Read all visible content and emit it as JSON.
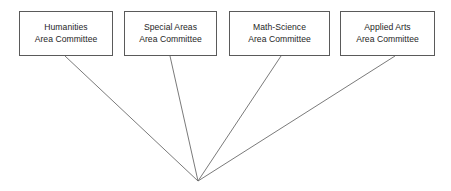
{
  "diagram": {
    "background_color": "#ffffff",
    "border_color": "#5a5a5a",
    "line_color": "#6b6b6b",
    "text_color": "#262626",
    "nodes": [
      {
        "id": "humanities",
        "line1": "Humanities",
        "line2": "Area Committee",
        "x": 19,
        "y": 11,
        "width": 94,
        "height": 45
      },
      {
        "id": "special-areas",
        "line1": "Special Areas",
        "line2": "Area Committee",
        "x": 124,
        "y": 11,
        "width": 93,
        "height": 45
      },
      {
        "id": "math-science",
        "line1": "Math-Science",
        "line2": "Area Committee",
        "x": 229,
        "y": 11,
        "width": 101,
        "height": 45
      },
      {
        "id": "applied-arts",
        "line1": "Applied Arts",
        "line2": "Area Committee",
        "x": 340,
        "y": 11,
        "width": 95,
        "height": 45
      }
    ],
    "convergence_point": {
      "x": 198,
      "y": 181
    },
    "connectors": [
      {
        "id": "connector-humanities",
        "from_x": 65,
        "from_y": 56,
        "to_x": 198,
        "to_y": 181
      },
      {
        "id": "connector-special-areas",
        "from_x": 170,
        "from_y": 56,
        "to_x": 198,
        "to_y": 181
      },
      {
        "id": "connector-math-science",
        "from_x": 281,
        "from_y": 56,
        "to_x": 198,
        "to_y": 181
      },
      {
        "id": "connector-applied-arts",
        "from_x": 395,
        "from_y": 56,
        "to_x": 198,
        "to_y": 181
      }
    ]
  }
}
